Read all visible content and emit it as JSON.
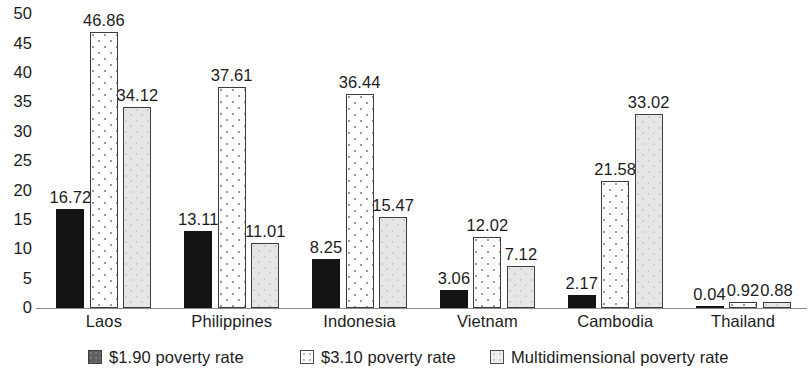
{
  "chart_data": {
    "type": "bar",
    "title": "",
    "xlabel": "",
    "ylabel": "",
    "ylim": [
      0,
      50
    ],
    "yticks": [
      0,
      5,
      10,
      15,
      20,
      25,
      30,
      35,
      40,
      45,
      50
    ],
    "ytick_labels": [
      "0",
      "5",
      "10",
      "15",
      "20",
      "25",
      "30",
      "35",
      "40",
      "45",
      "50"
    ],
    "grid": false,
    "legend_position": "bottom",
    "categories": [
      "Laos",
      "Philippines",
      "Indonesia",
      "Vietnam",
      "Cambodia",
      "Thailand"
    ],
    "series": [
      {
        "name": "$1.90 poverty rate",
        "values": [
          16.72,
          13.11,
          8.25,
          3.06,
          2.17,
          0.04
        ],
        "labels": [
          "16.72",
          "13.11",
          "8.25",
          "3.06",
          "2.17",
          "0.04"
        ],
        "color": "#141414",
        "pattern": "solid"
      },
      {
        "name": "$3.10 poverty rate",
        "values": [
          46.86,
          37.61,
          36.44,
          12.02,
          21.58,
          0.92
        ],
        "labels": [
          "46.86",
          "37.61",
          "36.44",
          "12.02",
          "21.58",
          "0.92"
        ],
        "color": "#fdfdfd",
        "pattern": "dotted"
      },
      {
        "name": "Multidimensional poverty rate",
        "values": [
          34.12,
          11.01,
          15.47,
          7.12,
          33.02,
          0.88
        ],
        "labels": [
          "34.12",
          "11.01",
          "15.47",
          "7.12",
          "33.02",
          "0.88"
        ],
        "color": "#e6e6e6",
        "pattern": "light-dotted"
      }
    ]
  },
  "legend": {
    "items": [
      {
        "label": "$1.90 poverty rate",
        "swatch": "legend-swatch-dark"
      },
      {
        "label": "$3.10 poverty rate",
        "swatch": "legend-swatch-dotted"
      },
      {
        "label": "Multidimensional poverty rate",
        "swatch": "legend-swatch-light"
      }
    ]
  }
}
